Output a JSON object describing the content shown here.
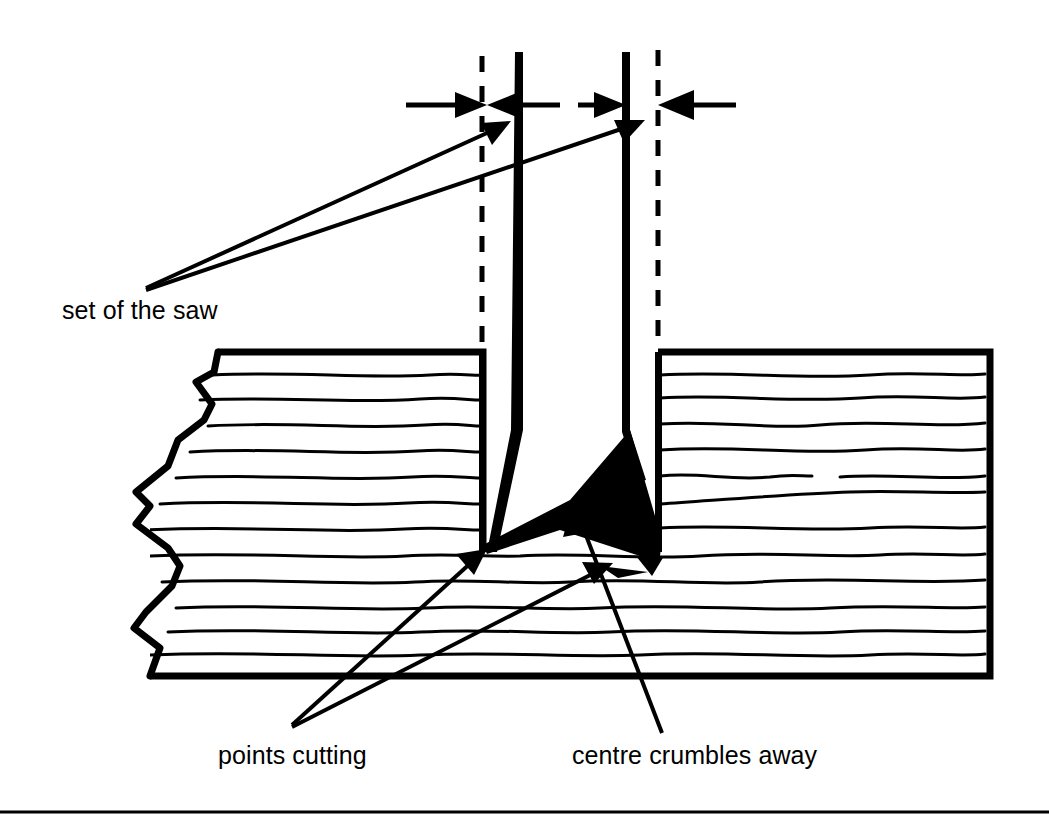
{
  "figure": {
    "kind": "technical-line-diagram",
    "background_color": "#ffffff",
    "ink_color": "#000000"
  },
  "labels": {
    "set_of_the_saw": "set of the saw",
    "points_cutting": "points cutting",
    "centre_crumbles_away": "centre crumbles away"
  },
  "icons": {
    "dimension_arrow_right": "arrow-right-icon",
    "dimension_arrow_left": "arrow-left-icon",
    "leader_arrow": "leader-arrow-icon"
  },
  "diagram": {
    "saw_blade": {
      "left_blade_x": 519,
      "right_blade_x": 626,
      "blade_top_y": 52,
      "blade_bottom_y": 552
    },
    "dashed_reference_lines": {
      "left_x": 482,
      "right_x": 658,
      "top_y": 52,
      "bottom_y": 350
    },
    "wood_block": {
      "top_y": 352,
      "bottom_y": 676,
      "right_x": 990,
      "torn_left_edge_x": 150,
      "grain_line_count": 13
    },
    "kerf": {
      "left_wall_x": 483,
      "right_wall_x": 658,
      "bottom_y": 552,
      "crumbled_wedge": "black filled wedge at kerf bottom"
    }
  },
  "footer_rule": {
    "y": 812,
    "thickness": 3
  }
}
